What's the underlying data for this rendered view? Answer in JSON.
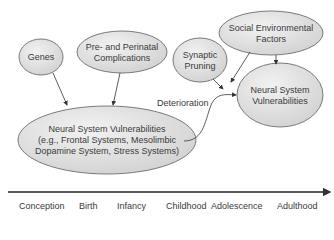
{
  "nodes": {
    "genes": {
      "label": "Genes"
    },
    "perinatal": {
      "line1": "Pre- and Perinatal",
      "line2": "Complications"
    },
    "social": {
      "line1": "Social Environmental",
      "line2": "Factors"
    },
    "pruning": {
      "line1": "Synaptic",
      "line2": "Pruning"
    },
    "vuln_early": {
      "line1": "Neural System Vulnerabilities",
      "line2": "(e.g., Frontal Systems, Mesolimbic",
      "line3": "Dopamine System, Stress Systems)"
    },
    "vuln_late": {
      "line1": "Neural System",
      "line2": "Vulnerabilities"
    }
  },
  "edge_labels": {
    "deterioration": "Deterioration"
  },
  "timeline": {
    "stages": [
      "Conception",
      "Birth",
      "Infancy",
      "Childhood",
      "Adolescence",
      "Adulthood"
    ]
  },
  "colors": {
    "ellipse_fill": "#e4e4e4",
    "ellipse_stroke": "#7a7a7a",
    "line": "#333333"
  }
}
